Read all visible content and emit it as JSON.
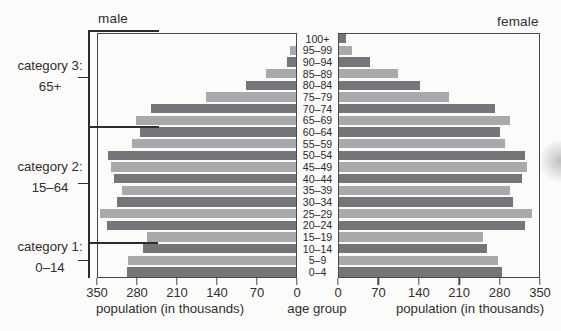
{
  "header": {
    "male_label": "male",
    "female_label": "female"
  },
  "categories": [
    {
      "name": "category 3:",
      "range": "65+"
    },
    {
      "name": "category 2:",
      "range": "15–64"
    },
    {
      "name": "category 1:",
      "range": "0–14"
    }
  ],
  "axis": {
    "male_ticks": [
      "350",
      "280",
      "210",
      "140",
      "70",
      "0"
    ],
    "female_ticks": [
      "0",
      "70",
      "140",
      "210",
      "280",
      "350"
    ],
    "male_caption": "population (in thousands)",
    "female_caption": "population (in thousands)",
    "center_caption": "age group"
  },
  "colors": {
    "bar_dark": "#747578",
    "bar_light": "#a8a9ab",
    "line": "#48484a",
    "bracket": "#2d2d2f",
    "text": "#302f2e",
    "background": "#fbfbf9"
  },
  "chart_data": {
    "type": "bar",
    "subtype": "population-pyramid",
    "unit": "thousands",
    "xlim": [
      0,
      350
    ],
    "tick_step": 70,
    "xlabel": "population (in thousands)",
    "center_label": "age group",
    "age_groups": [
      "100+",
      "95–99",
      "90–94",
      "85–89",
      "80–84",
      "75–79",
      "70–74",
      "65–69",
      "60–64",
      "55–59",
      "50–54",
      "45–49",
      "40–44",
      "35–39",
      "30–34",
      "25–29",
      "20–24",
      "15–19",
      "10–14",
      "5–9",
      "0–4"
    ],
    "series": [
      {
        "name": "male",
        "side": "left",
        "values": [
          2,
          12,
          17,
          55,
          90,
          160,
          255,
          281,
          275,
          289,
          330,
          326,
          321,
          307,
          315,
          345,
          333,
          263,
          270,
          296,
          298
        ]
      },
      {
        "name": "female",
        "side": "right",
        "values": [
          13,
          24,
          56,
          104,
          142,
          192,
          272,
          298,
          281,
          289,
          324,
          327,
          318,
          298,
          303,
          336,
          324,
          251,
          258,
          277,
          284
        ]
      }
    ],
    "category_brackets": [
      {
        "label": "category 3:",
        "range": "65+",
        "covers": "65–69 to 100+"
      },
      {
        "label": "category 2:",
        "range": "15–64",
        "covers": "15–19 to 60–64"
      },
      {
        "label": "category 1:",
        "range": "0–14",
        "covers": "0–4 to 10–14"
      }
    ],
    "legend": "dark/light bars alternate by 5-year age group"
  }
}
